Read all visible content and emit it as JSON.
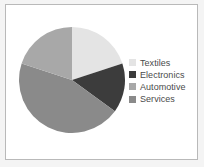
{
  "figure": {
    "background_color": "#f4f4f4",
    "panel_color": "#ffffff",
    "border_color": "#b9b9b9"
  },
  "legend": {
    "position": "right",
    "text_color": "#4a4a4a"
  },
  "chart_data": {
    "type": "pie",
    "title": "",
    "subtitle": "",
    "xlabel": "",
    "ylabel": "",
    "grid": false,
    "legend_position": "right",
    "start_angle_deg": 0,
    "direction": "clockwise",
    "labels": [
      "Textiles",
      "Electronics",
      "Automotive",
      "Services"
    ],
    "values": [
      20,
      15,
      20,
      45
    ],
    "units": "percent",
    "colors": [
      "#e4e4e4",
      "#3c3c3c",
      "#a8a8a8",
      "#8a8a8a"
    ],
    "slices": [
      {
        "label": "Textiles",
        "value": 20,
        "color": "#e4e4e4",
        "start_deg": 0,
        "end_deg": 72
      },
      {
        "label": "Electronics",
        "value": 15,
        "color": "#3c3c3c",
        "start_deg": 72,
        "end_deg": 126
      },
      {
        "label": "Services",
        "value": 45,
        "color": "#8a8a8a",
        "start_deg": 126,
        "end_deg": 288
      },
      {
        "label": "Automotive",
        "value": 20,
        "color": "#a8a8a8",
        "start_deg": 288,
        "end_deg": 360
      }
    ],
    "legend_entries": [
      {
        "label": "Textiles",
        "color": "#e4e4e4"
      },
      {
        "label": "Electronics",
        "color": "#3c3c3c"
      },
      {
        "label": "Automotive",
        "color": "#a8a8a8"
      },
      {
        "label": "Services",
        "color": "#8a8a8a"
      }
    ]
  }
}
